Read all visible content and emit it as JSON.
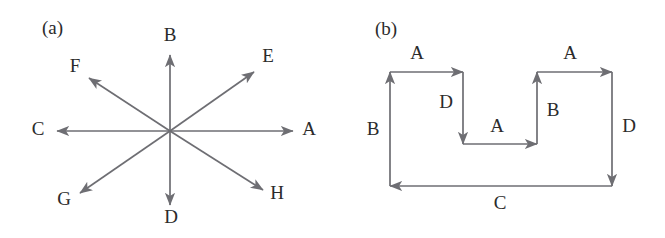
{
  "figure": {
    "background_color": "#ffffff",
    "line_color": "#6e6e73",
    "text_color": "#2b2b2b"
  },
  "panels": [
    {
      "tag": "(a)",
      "name": "star-vector-diagram",
      "description": "Eight arrows radiating from a common origin",
      "origin": {
        "x": 170,
        "y": 131
      },
      "vectors": [
        {
          "label": "A",
          "direction": "east",
          "angle_deg": 0,
          "tip": {
            "x": 293,
            "y": 131
          },
          "label_pos": {
            "x": 309,
            "y": 131
          }
        },
        {
          "label": "B",
          "direction": "north",
          "angle_deg": 90,
          "tip": {
            "x": 170,
            "y": 55
          },
          "label_pos": {
            "x": 170,
            "y": 37
          }
        },
        {
          "label": "C",
          "direction": "west",
          "angle_deg": 180,
          "tip": {
            "x": 57,
            "y": 131
          },
          "label_pos": {
            "x": 38,
            "y": 131
          }
        },
        {
          "label": "D",
          "direction": "south",
          "angle_deg": 270,
          "tip": {
            "x": 170,
            "y": 205
          },
          "label_pos": {
            "x": 171,
            "y": 219
          }
        },
        {
          "label": "E",
          "direction": "north-east",
          "angle_deg": 37,
          "tip": {
            "x": 254,
            "y": 72
          },
          "label_pos": {
            "x": 268,
            "y": 58
          }
        },
        {
          "label": "F",
          "direction": "north-west",
          "angle_deg": 143,
          "tip": {
            "x": 89,
            "y": 78
          },
          "label_pos": {
            "x": 75,
            "y": 68
          }
        },
        {
          "label": "G",
          "direction": "south-west",
          "angle_deg": 217,
          "tip": {
            "x": 80,
            "y": 193
          },
          "label_pos": {
            "x": 64,
            "y": 201
          }
        },
        {
          "label": "H",
          "direction": "south-east",
          "angle_deg": 323,
          "tip": {
            "x": 263,
            "y": 190
          },
          "label_pos": {
            "x": 277,
            "y": 195
          }
        }
      ]
    },
    {
      "tag": "(b)",
      "name": "crenellated-path-diagram",
      "description": "Closed orthogonal path of labelled arrow segments forming a U-shaped notch",
      "segments": [
        {
          "label": "A",
          "direction": "east",
          "from": {
            "x": 390,
            "y": 72
          },
          "to": {
            "x": 463,
            "y": 72
          },
          "label_pos": {
            "x": 417,
            "y": 55
          }
        },
        {
          "label": "D",
          "direction": "south",
          "from": {
            "x": 463,
            "y": 72
          },
          "to": {
            "x": 463,
            "y": 144
          },
          "label_pos": {
            "x": 446,
            "y": 104
          }
        },
        {
          "label": "A",
          "direction": "east",
          "from": {
            "x": 463,
            "y": 144
          },
          "to": {
            "x": 537,
            "y": 144
          },
          "label_pos": {
            "x": 497,
            "y": 128
          }
        },
        {
          "label": "B",
          "direction": "north",
          "from": {
            "x": 537,
            "y": 144
          },
          "to": {
            "x": 537,
            "y": 72
          },
          "label_pos": {
            "x": 553,
            "y": 112
          }
        },
        {
          "label": "A",
          "direction": "east",
          "from": {
            "x": 537,
            "y": 72
          },
          "to": {
            "x": 612,
            "y": 72
          },
          "label_pos": {
            "x": 570,
            "y": 55
          }
        },
        {
          "label": "D",
          "direction": "south",
          "from": {
            "x": 612,
            "y": 72
          },
          "to": {
            "x": 612,
            "y": 186
          },
          "label_pos": {
            "x": 629,
            "y": 128
          }
        },
        {
          "label": "C",
          "direction": "west",
          "from": {
            "x": 612,
            "y": 186
          },
          "to": {
            "x": 390,
            "y": 186
          },
          "label_pos": {
            "x": 500,
            "y": 205
          }
        },
        {
          "label": "B",
          "direction": "north",
          "from": {
            "x": 390,
            "y": 186
          },
          "to": {
            "x": 390,
            "y": 72
          },
          "label_pos": {
            "x": 373,
            "y": 131
          }
        }
      ]
    }
  ],
  "panel_tags": {
    "a": {
      "text": "(a)",
      "x": 42,
      "y": 30
    },
    "b": {
      "text": "(b)",
      "x": 375,
      "y": 31
    }
  }
}
